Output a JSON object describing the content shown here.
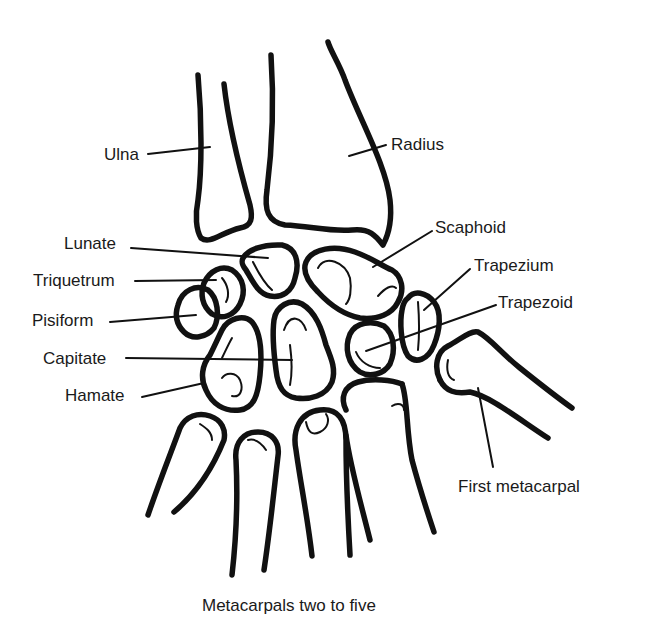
{
  "figure": {
    "line_color": "#111111",
    "background": "#ffffff"
  },
  "labels": {
    "ulna": "Ulna",
    "radius": "Radius",
    "scaphoid": "Scaphoid",
    "lunate": "Lunate",
    "trapezium": "Trapezium",
    "triquetrum": "Triquetrum",
    "trapezoid": "Trapezoid",
    "pisiform": "Pisiform",
    "capitate": "Capitate",
    "hamate": "Hamate",
    "first_metacarpal": "First metacarpal",
    "metacarpals_two_to_five": "Metacarpals two to five"
  }
}
